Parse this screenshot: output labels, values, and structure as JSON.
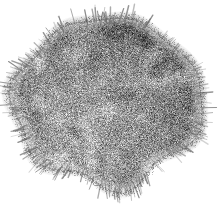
{
  "figure": {
    "title": "Virus particle electron micrograph",
    "modality": "transmission electron micrograph",
    "colorspace": "grayscale",
    "caption": ""
  },
  "canvas": {
    "width": 218,
    "height": 204,
    "background_color": "#ffffff"
  },
  "particle": {
    "name": "virion",
    "shape": "rounded lobed sphere",
    "center_x": 107,
    "center_y": 101,
    "radius_x": 90,
    "radius_y": 84,
    "outline_wobble": 0.085,
    "edge_softness": 9,
    "body_mean_gray": 150,
    "body_dark_gray": 58,
    "body_light_gray": 228,
    "grain_amplitude": 54,
    "grain_scale": 1.0,
    "mottle_count": 150,
    "mottle_min_radius": 4,
    "mottle_max_radius": 17,
    "shading": {
      "darker_quadrant": "upper-right",
      "lighter_quadrant": "lower-left",
      "gradient_strength": 34
    }
  },
  "spikes": {
    "name": "surface peplomers",
    "count": 230,
    "min_length": 3,
    "max_length": 17,
    "thickness": 1,
    "color_gray": 110,
    "fringe_band": 7
  },
  "render": {
    "noise_seed": 20240617,
    "fringe_speckle_count": 2600
  }
}
